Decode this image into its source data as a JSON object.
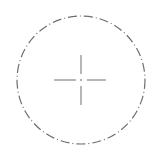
{
  "drawing": {
    "title": "Circle with center mark",
    "background": "#ffffff",
    "line_color": "#6e6e6e",
    "circle": {
      "cx": 81,
      "cy": 80,
      "r": 64,
      "stroke_width": 1.2,
      "line_type": "dash-dot",
      "dasharray": "9 3 1 3"
    },
    "center_mark": {
      "cx": 81,
      "cy": 80,
      "horizontal": {
        "left_arm": [
          54,
          76
        ],
        "right_arm": [
          87,
          106
        ]
      },
      "vertical": {
        "top_arm": [
          55,
          74
        ],
        "bottom_arm": [
          86,
          105
        ]
      },
      "center_dot_size": 1.5,
      "stroke_width": 1
    }
  }
}
